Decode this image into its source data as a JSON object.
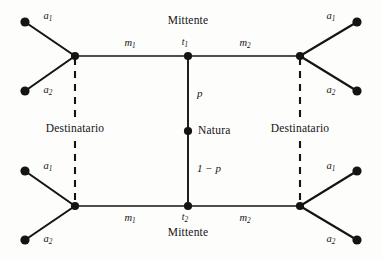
{
  "figure": {
    "type": "extensive-form-game-tree",
    "background_color": "#fdfdfc",
    "ink_color": "#141414"
  },
  "players": {
    "sender_top_label": "Mittente",
    "sender_bottom_label": "Mittente",
    "receiver_left_label": "Destinatario",
    "receiver_right_label": "Destinatario",
    "nature_label": "Natura"
  },
  "decision_nodes": {
    "t1_label": "t",
    "t1_sub": "1",
    "t2_label": "t",
    "t2_sub": "2"
  },
  "probabilities": {
    "top_branch": "p",
    "bottom_branch": "1 − p"
  },
  "messages": {
    "top_left": {
      "base": "m",
      "sub": "1"
    },
    "top_right": {
      "base": "m",
      "sub": "2"
    },
    "bottom_left": {
      "base": "m",
      "sub": "1"
    },
    "bottom_right": {
      "base": "m",
      "sub": "2"
    }
  },
  "actions": {
    "top_left_upper": {
      "base": "a",
      "sub": "1"
    },
    "top_left_lower": {
      "base": "a",
      "sub": "2"
    },
    "top_right_upper": {
      "base": "a",
      "sub": "1"
    },
    "top_right_lower": {
      "base": "a",
      "sub": "2"
    },
    "bottom_left_upper": {
      "base": "a",
      "sub": "1"
    },
    "bottom_left_lower": {
      "base": "a",
      "sub": "2"
    },
    "bottom_right_upper": {
      "base": "a",
      "sub": "1"
    },
    "bottom_right_lower": {
      "base": "a",
      "sub": "2"
    }
  },
  "geometry": {
    "nature": {
      "x": 188,
      "y": 131
    },
    "t1": {
      "x": 188,
      "y": 56
    },
    "t2": {
      "x": 188,
      "y": 206
    },
    "receiver_top_left": {
      "x": 75,
      "y": 56
    },
    "receiver_top_right": {
      "x": 300,
      "y": 56
    },
    "receiver_bottom_left": {
      "x": 75,
      "y": 206
    },
    "receiver_bottom_right": {
      "x": 300,
      "y": 206
    },
    "terminals": [
      {
        "x": 25,
        "y": 22
      },
      {
        "x": 25,
        "y": 91
      },
      {
        "x": 357,
        "y": 22
      },
      {
        "x": 357,
        "y": 91
      },
      {
        "x": 25,
        "y": 171
      },
      {
        "x": 25,
        "y": 240
      },
      {
        "x": 357,
        "y": 171
      },
      {
        "x": 357,
        "y": 240
      }
    ]
  }
}
